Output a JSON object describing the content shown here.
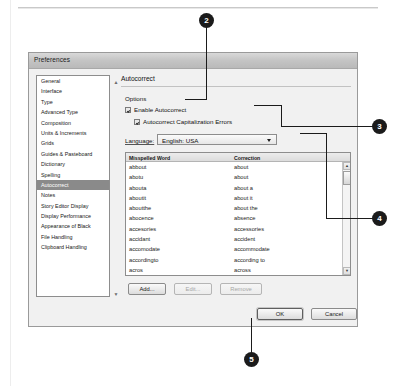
{
  "dialog": {
    "title": "Preferences",
    "categories": [
      {
        "label": "General",
        "selected": false
      },
      {
        "label": "Interface",
        "selected": false
      },
      {
        "label": "Type",
        "selected": false
      },
      {
        "label": "Advanced Type",
        "selected": false
      },
      {
        "label": "Composition",
        "selected": false
      },
      {
        "label": "Units & Increments",
        "selected": false
      },
      {
        "label": "Grids",
        "selected": false
      },
      {
        "label": "Guides & Pasteboard",
        "selected": false
      },
      {
        "label": "Dictionary",
        "selected": false
      },
      {
        "label": "Spelling",
        "selected": false
      },
      {
        "label": "Autocorrect",
        "selected": true
      },
      {
        "label": "Notes",
        "selected": false
      },
      {
        "label": "Story Editor Display",
        "selected": false
      },
      {
        "label": "Display Performance",
        "selected": false
      },
      {
        "label": "Appearance of Black",
        "selected": false
      },
      {
        "label": "File Handling",
        "selected": false
      },
      {
        "label": "Clipboard Handling",
        "selected": false
      }
    ],
    "pane": {
      "title": "Autocorrect",
      "options_label": "Options",
      "checkbox_enable": {
        "label": "Enable Autocorrect",
        "checked": true
      },
      "checkbox_caps": {
        "label": "Autocorrect Capitalization Errors",
        "checked": true
      },
      "language_label": "Language:",
      "language_value": "English: USA",
      "table": {
        "headers": [
          "Misspelled Word",
          "Correction"
        ],
        "rows": [
          {
            "misspelled": "abbout",
            "correction": "about"
          },
          {
            "misspelled": "abotu",
            "correction": "about"
          },
          {
            "misspelled": "abouta",
            "correction": "about a"
          },
          {
            "misspelled": "aboutit",
            "correction": "about it"
          },
          {
            "misspelled": "aboutthe",
            "correction": "about the"
          },
          {
            "misspelled": "abocence",
            "correction": "absence"
          },
          {
            "misspelled": "accesories",
            "correction": "accessories"
          },
          {
            "misspelled": "accidant",
            "correction": "accident"
          },
          {
            "misspelled": "accomodate",
            "correction": "accommodate"
          },
          {
            "misspelled": "accordingto",
            "correction": "according to"
          },
          {
            "misspelled": "acros",
            "correction": "across"
          },
          {
            "misspelled": "acheive",
            "correction": "achieve"
          },
          {
            "misspelled": "acheived",
            "correction": "achieved"
          }
        ]
      },
      "buttons": {
        "add": "Add...",
        "edit": "Edit...",
        "remove": "Remove"
      }
    },
    "footer": {
      "ok": "OK",
      "cancel": "Cancel"
    }
  },
  "callouts": [
    {
      "number": "2"
    },
    {
      "number": "3"
    },
    {
      "number": "4"
    },
    {
      "number": "5"
    }
  ]
}
